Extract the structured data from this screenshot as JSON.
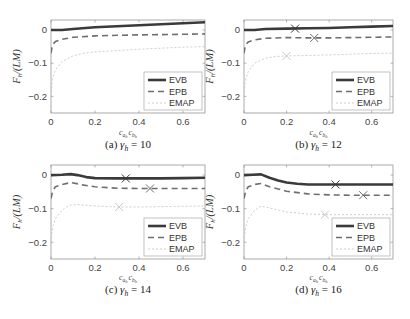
{
  "figure": {
    "ylabel": "F_h/(LM)",
    "xlabel": "c_{a_h} c_{b_h}",
    "legend": [
      "EVB",
      "EPB",
      "EMAP"
    ],
    "colors": {
      "EVB": "#3a3a3a",
      "EPB": "#6e6e6e",
      "EMAP": "#c8c8c8",
      "axis": "#888888",
      "tick_text": "#444444"
    }
  },
  "chart_data": [
    {
      "type": "line",
      "panel": "a",
      "caption": "(a) γ_h = 10",
      "caption_prefix": "(a)",
      "caption_gamma": "γ",
      "caption_sub": "h",
      "caption_value": "= 10",
      "xlabel": "c_{a_h} c_{b_h}",
      "ylabel": "F_h/(LM)",
      "xlim": [
        0,
        0.7
      ],
      "ylim": [
        -0.25,
        0.03
      ],
      "xticks": [
        0,
        0.2,
        0.4,
        0.6
      ],
      "yticks": [
        0,
        -0.1,
        -0.2
      ],
      "legend_position": "lower right",
      "grid": false,
      "series": [
        {
          "name": "EVB",
          "x": [
            0,
            0.05,
            0.1,
            0.2,
            0.3,
            0.4,
            0.5,
            0.6,
            0.7
          ],
          "y": [
            0.0,
            0.0,
            0.003,
            0.008,
            0.011,
            0.014,
            0.017,
            0.02,
            0.023
          ],
          "marker_x": null
        },
        {
          "name": "EPB",
          "x": [
            0,
            0.005,
            0.01,
            0.02,
            0.05,
            0.1,
            0.2,
            0.3,
            0.4,
            0.5,
            0.6,
            0.7
          ],
          "y": [
            -0.07,
            -0.05,
            -0.042,
            -0.035,
            -0.028,
            -0.022,
            -0.018,
            -0.016,
            -0.015,
            -0.014,
            -0.013,
            -0.012
          ],
          "marker_x": null
        },
        {
          "name": "EMAP",
          "x": [
            0,
            0.005,
            0.01,
            0.02,
            0.05,
            0.1,
            0.15,
            0.2,
            0.3,
            0.4,
            0.5,
            0.6,
            0.7
          ],
          "y": [
            -0.2,
            -0.16,
            -0.14,
            -0.12,
            -0.095,
            -0.078,
            -0.07,
            -0.066,
            -0.062,
            -0.058,
            -0.055,
            -0.052,
            -0.05
          ],
          "marker_x": null
        }
      ]
    },
    {
      "type": "line",
      "panel": "b",
      "caption": "(b) γ_h = 12",
      "caption_prefix": "(b)",
      "caption_gamma": "γ",
      "caption_sub": "h",
      "caption_value": "= 12",
      "xlabel": "c_{a_h} c_{b_h}",
      "ylabel": "F_h/(LM)",
      "xlim": [
        0,
        0.7
      ],
      "ylim": [
        -0.25,
        0.03
      ],
      "xticks": [
        0,
        0.2,
        0.4,
        0.6
      ],
      "yticks": [
        0,
        -0.1,
        -0.2
      ],
      "legend_position": "lower right",
      "grid": false,
      "series": [
        {
          "name": "EVB",
          "x": [
            0,
            0.05,
            0.1,
            0.2,
            0.3,
            0.4,
            0.5,
            0.6,
            0.7
          ],
          "y": [
            0.0,
            0.0,
            0.003,
            0.004,
            0.005,
            0.006,
            0.008,
            0.01,
            0.012
          ],
          "marker_x": 0.24,
          "marker_y": 0.004
        },
        {
          "name": "EPB",
          "x": [
            0,
            0.005,
            0.01,
            0.02,
            0.05,
            0.1,
            0.2,
            0.3,
            0.4,
            0.5,
            0.6,
            0.7
          ],
          "y": [
            -0.07,
            -0.05,
            -0.043,
            -0.036,
            -0.03,
            -0.025,
            -0.023,
            -0.024,
            -0.024,
            -0.023,
            -0.022,
            -0.021
          ],
          "marker_x": 0.33,
          "marker_y": -0.024
        },
        {
          "name": "EMAP",
          "x": [
            0,
            0.005,
            0.01,
            0.02,
            0.05,
            0.1,
            0.15,
            0.2,
            0.3,
            0.4,
            0.5,
            0.6,
            0.7
          ],
          "y": [
            -0.2,
            -0.16,
            -0.145,
            -0.125,
            -0.1,
            -0.085,
            -0.08,
            -0.078,
            -0.077,
            -0.075,
            -0.073,
            -0.071,
            -0.07
          ],
          "marker_x": 0.2,
          "marker_y": -0.078
        }
      ]
    },
    {
      "type": "line",
      "panel": "c",
      "caption": "(c) γ_h = 14",
      "caption_prefix": "(c)",
      "caption_gamma": "γ",
      "caption_sub": "h",
      "caption_value": "= 14",
      "xlabel": "c_{a_h} c_{b_h}",
      "ylabel": "F_h/(LM)",
      "xlim": [
        0,
        0.7
      ],
      "ylim": [
        -0.25,
        0.03
      ],
      "xticks": [
        0,
        0.2,
        0.4,
        0.6
      ],
      "yticks": [
        0,
        -0.1,
        -0.2
      ],
      "legend_position": "lower right",
      "grid": false,
      "series": [
        {
          "name": "EVB",
          "x": [
            0,
            0.05,
            0.09,
            0.12,
            0.16,
            0.2,
            0.3,
            0.4,
            0.5,
            0.6,
            0.7
          ],
          "y": [
            0.0,
            0.001,
            0.003,
            0.0,
            -0.006,
            -0.009,
            -0.01,
            -0.01,
            -0.01,
            -0.009,
            -0.008
          ],
          "marker_x": 0.34,
          "marker_y": -0.01
        },
        {
          "name": "EPB",
          "x": [
            0,
            0.005,
            0.01,
            0.02,
            0.05,
            0.09,
            0.15,
            0.2,
            0.3,
            0.4,
            0.5,
            0.6,
            0.7
          ],
          "y": [
            -0.07,
            -0.055,
            -0.045,
            -0.035,
            -0.028,
            -0.022,
            -0.03,
            -0.035,
            -0.039,
            -0.04,
            -0.04,
            -0.04,
            -0.04
          ],
          "marker_x": 0.45,
          "marker_y": -0.04
        },
        {
          "name": "EMAP",
          "x": [
            0,
            0.005,
            0.01,
            0.02,
            0.05,
            0.08,
            0.12,
            0.2,
            0.3,
            0.4,
            0.5,
            0.6,
            0.7
          ],
          "y": [
            -0.2,
            -0.17,
            -0.15,
            -0.13,
            -0.105,
            -0.09,
            -0.088,
            -0.092,
            -0.095,
            -0.095,
            -0.094,
            -0.093,
            -0.092
          ],
          "marker_x": 0.31,
          "marker_y": -0.095
        }
      ]
    },
    {
      "type": "line",
      "panel": "d",
      "caption": "(d) γ_h = 16",
      "caption_prefix": "(d)",
      "caption_gamma": "γ",
      "caption_sub": "h",
      "caption_value": "= 16",
      "xlabel": "c_{a_h} c_{b_h}",
      "ylabel": "F_h/(LM)",
      "xlim": [
        0,
        0.7
      ],
      "ylim": [
        -0.25,
        0.03
      ],
      "xticks": [
        0,
        0.2,
        0.4,
        0.6
      ],
      "yticks": [
        0,
        -0.1,
        -0.2
      ],
      "legend_position": "lower right",
      "grid": false,
      "series": [
        {
          "name": "EVB",
          "x": [
            0,
            0.04,
            0.08,
            0.12,
            0.16,
            0.2,
            0.25,
            0.3,
            0.4,
            0.5,
            0.6,
            0.7
          ],
          "y": [
            0.0,
            0.001,
            0.002,
            -0.008,
            -0.016,
            -0.022,
            -0.026,
            -0.028,
            -0.028,
            -0.028,
            -0.028,
            -0.028
          ],
          "marker_x": 0.43,
          "marker_y": -0.028
        },
        {
          "name": "EPB",
          "x": [
            0,
            0.005,
            0.01,
            0.02,
            0.05,
            0.08,
            0.12,
            0.2,
            0.3,
            0.4,
            0.5,
            0.6,
            0.7
          ],
          "y": [
            -0.07,
            -0.055,
            -0.045,
            -0.035,
            -0.028,
            -0.025,
            -0.035,
            -0.048,
            -0.056,
            -0.059,
            -0.06,
            -0.06,
            -0.06
          ],
          "marker_x": 0.56,
          "marker_y": -0.06
        },
        {
          "name": "EMAP",
          "x": [
            0,
            0.005,
            0.01,
            0.02,
            0.05,
            0.08,
            0.12,
            0.2,
            0.3,
            0.4,
            0.5,
            0.6,
            0.7
          ],
          "y": [
            -0.2,
            -0.17,
            -0.15,
            -0.13,
            -0.105,
            -0.092,
            -0.098,
            -0.11,
            -0.116,
            -0.118,
            -0.118,
            -0.118,
            -0.118
          ],
          "marker_x": 0.38,
          "marker_y": -0.118
        }
      ]
    }
  ]
}
